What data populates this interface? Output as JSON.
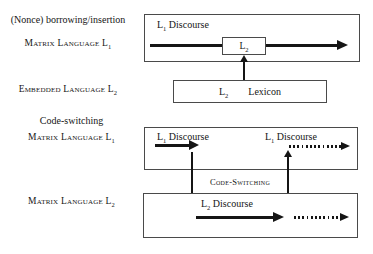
{
  "colors": {
    "background": "#ffffff",
    "ink": "#151515",
    "box_border": "#4a4a4a"
  },
  "left_column": {
    "borrowing_heading": "(Nonce) borrowing/insertion",
    "matrix_language_l1_top": {
      "base": "Matrix Language L",
      "sub": "1"
    },
    "embedded_language_l2": {
      "base": "Embedded Language L",
      "sub": "2"
    },
    "codeswitching_heading": "Code-switching",
    "matrix_language_l1_cs": {
      "base": "Matrix Language L",
      "sub": "1"
    },
    "matrix_language_l2_cs": {
      "base": "Matrix Language L",
      "sub": "2"
    }
  },
  "borrowing_diagram": {
    "l1_discourse_box_label": {
      "base": "L",
      "sub": "1",
      "rest": " Discourse"
    },
    "l2_insert_label": {
      "base": "L",
      "sub": "2"
    },
    "lexicon_box": {
      "lang": {
        "base": "L",
        "sub": "2"
      },
      "word": "Lexicon"
    }
  },
  "codeswitching_diagram": {
    "codeswitching_label": "Code-Switching",
    "l1_box": {
      "left_discourse": {
        "base": "L",
        "sub": "1",
        "rest": " Discourse"
      },
      "right_discourse": {
        "base": "L",
        "sub": "1",
        "rest": " Discourse"
      }
    },
    "l2_box": {
      "discourse": {
        "base": "L",
        "sub": "2",
        "rest": " Discourse"
      }
    }
  }
}
